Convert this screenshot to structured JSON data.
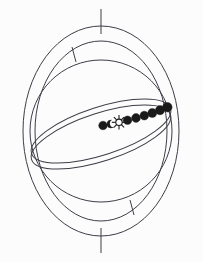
{
  "figure": {
    "name": "armillary-sphere-diagram",
    "background_color": "#fcfcfc",
    "line_color": "#3d3d47",
    "body_color": "#1a1a1a"
  },
  "geometry": {
    "center_x": 101,
    "center_y": 131,
    "outer_ring_outer_rx": 78,
    "outer_ring_outer_ry": 105,
    "outer_ring_inner_rx": 66,
    "outer_ring_inner_ry": 90,
    "sphere_r": 71,
    "ellipse_rx": 73,
    "ellipse_ry": 24,
    "ellipse_rotation_deg": -18
  },
  "axis": {
    "name": "polar-axis",
    "top_label": "north-pole-axis",
    "bottom_label": "south-pole-axis",
    "top_y_start": 9,
    "top_y_end": 34,
    "bottom_y_start": 228,
    "bottom_y_end": 253
  },
  "ticks": [
    {
      "name": "tick-upper-left",
      "x1": 72,
      "y1": 47,
      "x2": 76,
      "y2": 62
    },
    {
      "name": "tick-lower-right",
      "x1": 130,
      "y1": 200,
      "x2": 134,
      "y2": 215
    }
  ],
  "bodies": [
    {
      "name": "body-1-disc",
      "symbol": "filled-disc",
      "cx": 103.0,
      "cy": 125.5,
      "r": 4.3
    },
    {
      "name": "body-2-crescent",
      "symbol": "crescent",
      "cx": 111.0,
      "cy": 124.0,
      "r": 4.0
    },
    {
      "name": "body-3-sun",
      "symbol": "sun-star",
      "cx": 119.0,
      "cy": 122.3,
      "r": 3.2
    },
    {
      "name": "body-4-disc",
      "symbol": "filled-disc",
      "cx": 127.5,
      "cy": 120.2,
      "r": 4.3
    },
    {
      "name": "body-5-disc",
      "symbol": "filled-disc",
      "cx": 136.0,
      "cy": 118.0,
      "r": 4.4
    },
    {
      "name": "body-6-disc",
      "symbol": "filled-disc",
      "cx": 144.3,
      "cy": 115.6,
      "r": 4.4
    },
    {
      "name": "body-7-disc",
      "symbol": "filled-disc",
      "cx": 152.3,
      "cy": 113.0,
      "r": 4.5
    },
    {
      "name": "body-8-disc",
      "symbol": "filled-disc",
      "cx": 160.0,
      "cy": 110.2,
      "r": 4.6
    },
    {
      "name": "body-9-disc",
      "symbol": "filled-disc",
      "cx": 167.3,
      "cy": 107.2,
      "r": 4.8
    }
  ]
}
